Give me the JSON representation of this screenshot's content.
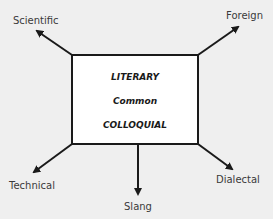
{
  "diagram": {
    "center_box": {
      "lines": [
        "LITERARY",
        "Common",
        "COLLOQUIAL"
      ]
    },
    "arrows": [
      {
        "label": "Scientific",
        "direction": "up-left"
      },
      {
        "label": "Foreign",
        "direction": "up-right"
      },
      {
        "label": "Technical",
        "direction": "down-left"
      },
      {
        "label": "Slang",
        "direction": "down"
      },
      {
        "label": "Dialectal",
        "direction": "down-right"
      }
    ],
    "colors": {
      "background": "#efefef",
      "box_fill": "#ffffff",
      "stroke": "#1a1a1a",
      "text": "#3a3a3a"
    }
  }
}
